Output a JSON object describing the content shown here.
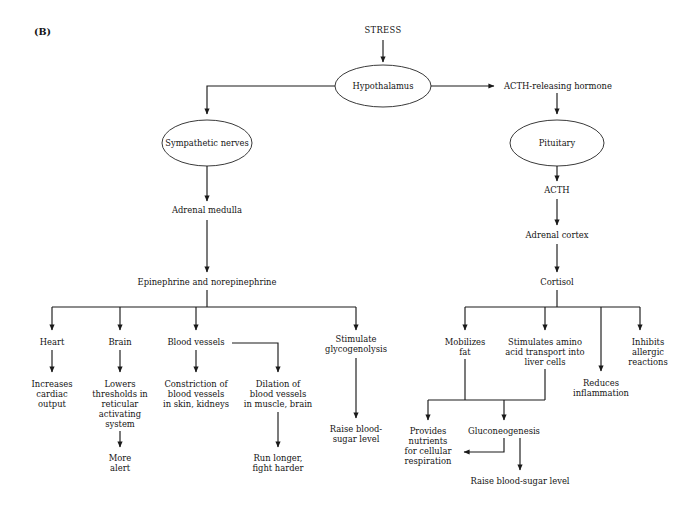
{
  "figure": {
    "panel_label": "(B)",
    "title_node": "STRESS"
  },
  "nodes": {
    "stress": "STRESS",
    "hypothalamus": "Hypothalamus",
    "sympathetic_nerves": "Sympathetic nerves",
    "acth_releasing_hormone": "ACTH-releasing hormone",
    "pituitary": "Pituitary",
    "acth": "ACTH",
    "adrenal_medulla": "Adrenal medulla",
    "adrenal_cortex": "Adrenal cortex",
    "epinephrine": "Epinephrine and norepinephrine",
    "cortisol": "Cortisol",
    "heart": "Heart",
    "brain": "Brain",
    "blood_vessels": "Blood vessels",
    "stimulate_glycogenolysis_1": "Stimulate",
    "stimulate_glycogenolysis_2": "glycogenolysis",
    "increases_cardiac_1": "Increases",
    "increases_cardiac_2": "cardiac",
    "increases_cardiac_3": "output",
    "lowers_thresholds_1": "Lowers",
    "lowers_thresholds_2": "thresholds in",
    "lowers_thresholds_3": "reticular",
    "lowers_thresholds_4": "activating",
    "lowers_thresholds_5": "system",
    "more_alert_1": "More",
    "more_alert_2": "alert",
    "constriction_1": "Constriction of",
    "constriction_2": "blood vessels",
    "constriction_3": "in skin, kidneys",
    "dilation_1": "Dilation of",
    "dilation_2": "blood vessels",
    "dilation_3": "in muscle, brain",
    "run_longer_1": "Run longer,",
    "run_longer_2": "fight harder",
    "raise_blood_sugar_left_1": "Raise blood-",
    "raise_blood_sugar_left_2": "sugar level",
    "mobilizes_fat_1": "Mobilizes",
    "mobilizes_fat_2": "fat",
    "stimulates_amino_1": "Stimulates amino",
    "stimulates_amino_2": "acid transport into",
    "stimulates_amino_3": "liver cells",
    "reduces_inflammation_1": "Reduces",
    "reduces_inflammation_2": "inflammation",
    "inhibits_allergic_1": "Inhibits",
    "inhibits_allergic_2": "allergic",
    "inhibits_allergic_3": "reactions",
    "provides_nutrients_1": "Provides",
    "provides_nutrients_2": "nutrients",
    "provides_nutrients_3": "for cellular",
    "provides_nutrients_4": "respiration",
    "gluconeogenesis": "Gluconeogenesis",
    "raise_blood_sugar_right": "Raise blood-sugar level"
  },
  "colors": {
    "line": "#1a1a1a",
    "ellipse_stroke": "#3a3a3a",
    "text": "#141414",
    "background": "#ffffff"
  }
}
